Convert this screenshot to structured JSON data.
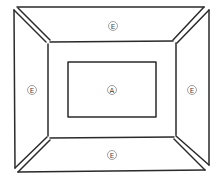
{
  "diagram": {
    "colors": {
      "line": "#2a2a2a",
      "label_circle": "#8a8a8a",
      "label_text": "#444444",
      "background": "#ffffff"
    },
    "labels": {
      "top": "E",
      "left": "E",
      "center": "A",
      "right": "E",
      "bottom": "E"
    }
  }
}
